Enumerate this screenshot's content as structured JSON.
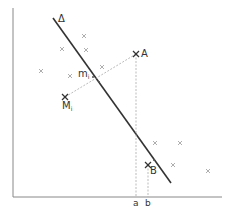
{
  "diagram": {
    "axes": {
      "origin": [
        13,
        197
      ],
      "x_end": 222,
      "y_top": 8,
      "color": "#888888"
    },
    "regression_line": {
      "label": "Δ",
      "from": [
        53,
        18
      ],
      "to": [
        171,
        183
      ],
      "color": "#333333"
    },
    "points": {
      "A": {
        "label": "A",
        "pos": [
          136,
          54
        ]
      },
      "B": {
        "label": "B",
        "pos": [
          148,
          165
        ]
      },
      "Mi": {
        "label": "M",
        "subscript": "i",
        "pos": [
          65,
          97
        ]
      },
      "mi": {
        "label": "m",
        "subscript": "i",
        "pos": [
          93,
          76
        ]
      }
    },
    "axis_ticks": [
      {
        "label": "a",
        "x": 136
      },
      {
        "label": "b",
        "x": 148
      }
    ],
    "scatter": [
      [
        84,
        36
      ],
      [
        62,
        49
      ],
      [
        86,
        50
      ],
      [
        41,
        71
      ],
      [
        70,
        76
      ],
      [
        102,
        67
      ],
      [
        155,
        143
      ],
      [
        180,
        143
      ],
      [
        173,
        165
      ],
      [
        208,
        171
      ]
    ],
    "caption": "Fig. 10.5. Droite de régression"
  }
}
